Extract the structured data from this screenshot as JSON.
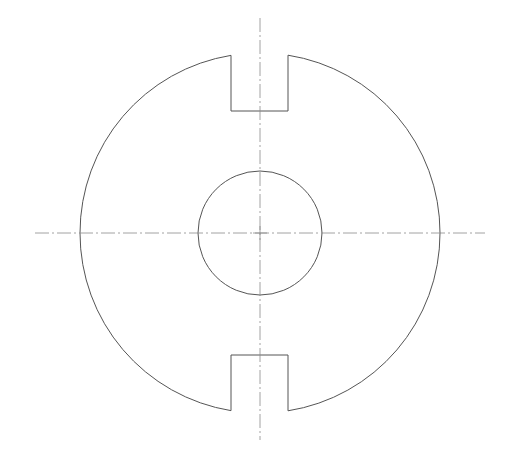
{
  "drawing": {
    "title": "",
    "colors": {
      "outline": "#555555",
      "centerline": "#8a8a8a",
      "background": "#ffffff"
    },
    "center": {
      "x": 260,
      "y": 233
    },
    "outer_circle": {
      "r": 180
    },
    "inner_circle": {
      "r": 62
    },
    "slots": [
      {
        "name": "top-slot",
        "x_left": 231,
        "x_right": 288,
        "depth_y": 111
      },
      {
        "name": "bottom-slot",
        "x_left": 231,
        "x_right": 288,
        "depth_y": 355
      }
    ],
    "centerlines": {
      "vertical": {
        "x": 260,
        "y1": 18,
        "y2": 440
      },
      "horizontal": {
        "y": 233,
        "x1": 35,
        "x2": 485
      }
    }
  }
}
